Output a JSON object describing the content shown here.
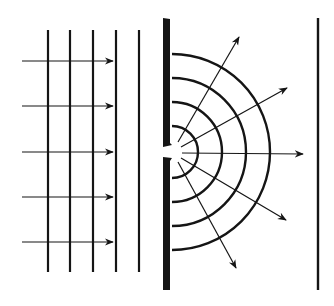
{
  "diagram": {
    "colors": {
      "ink": "#151515",
      "background": "#ffffff"
    },
    "incident_wavefronts": {
      "x": [
        48,
        70,
        93,
        116,
        139
      ],
      "y_top": 30,
      "y_bottom": 272
    },
    "incident_rays": {
      "y": [
        61,
        106,
        152,
        197,
        242
      ],
      "x_start": 22,
      "x_end": 113
    },
    "barrier": {
      "x": 163,
      "width": 7,
      "y_top": 18,
      "y_bottom": 290,
      "slit_y_top": 145,
      "slit_y_bottom": 158
    },
    "screen": {
      "x": 318,
      "y_top": 18,
      "y_bottom": 290
    },
    "diffracted_wavefronts": {
      "cx": 172,
      "cy": 152,
      "radii": [
        26,
        50,
        74,
        98
      ]
    },
    "diffracted_rays": [
      {
        "x1": 178,
        "y1": 142,
        "x2": 239,
        "y2": 37
      },
      {
        "x1": 181,
        "y1": 147,
        "x2": 287,
        "y2": 88
      },
      {
        "x1": 182,
        "y1": 153,
        "x2": 303,
        "y2": 154
      },
      {
        "x1": 181,
        "y1": 158,
        "x2": 286,
        "y2": 220
      },
      {
        "x1": 178,
        "y1": 162,
        "x2": 236,
        "y2": 268
      }
    ]
  }
}
